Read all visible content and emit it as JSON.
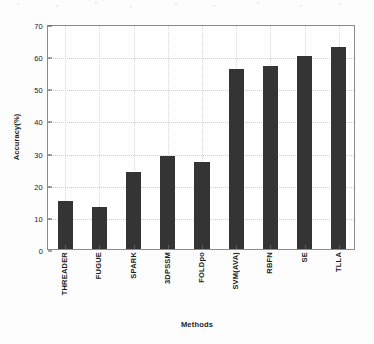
{
  "chart_data": {
    "type": "bar",
    "title": "",
    "xlabel": "Methods",
    "ylabel": "Accuracy(%)",
    "categories": [
      "THREADER",
      "FUGUE",
      "SPARK",
      "3DPSSM",
      "FOLDpo",
      "SVM(AVA)",
      "RBFN",
      "SE",
      "TLLA"
    ],
    "values": [
      15,
      13,
      24,
      29,
      27,
      56,
      57,
      60,
      63
    ],
    "ylim": [
      0,
      70
    ],
    "yticks": [
      0,
      10,
      20,
      30,
      40,
      50,
      60,
      70
    ],
    "ytick_labels": [
      "0",
      "10",
      "20",
      "30",
      "40",
      "50",
      "60",
      "70"
    ],
    "grid": true,
    "legend": "none",
    "bar_color": "#343434",
    "axis_color": "#8a8a8a",
    "grid_color": "#cfcfcf",
    "background_color": "#ffffff"
  }
}
